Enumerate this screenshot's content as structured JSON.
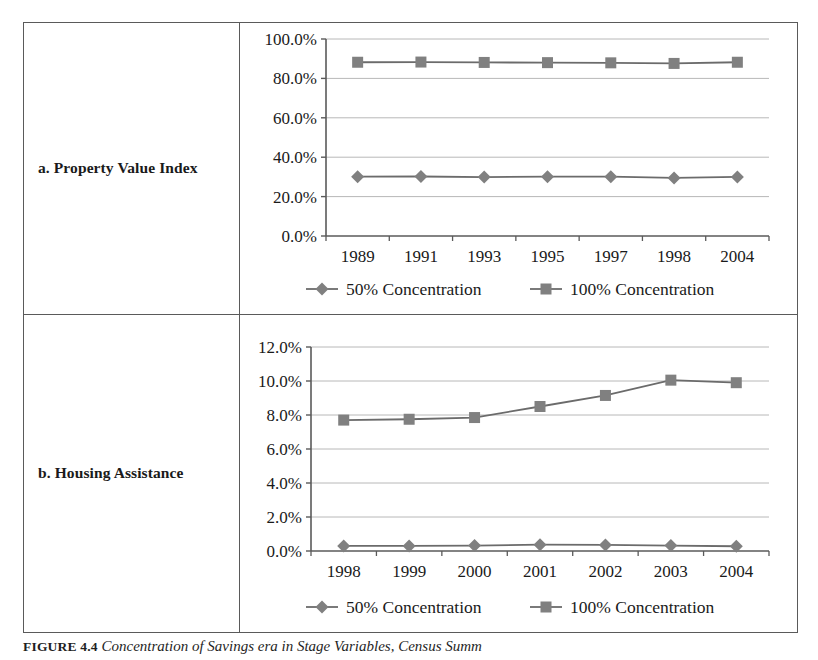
{
  "figure": {
    "caption_label": "FIGURE 4.4",
    "caption_text": "Concentration of Savings era in Stage Variables, Census Summ"
  },
  "rows": [
    {
      "label": "a. Property Value Index"
    },
    {
      "label": "b. Housing Assistance"
    }
  ],
  "legend": {
    "series_50_label": "50% Concentration",
    "series_100_label": "100% Concentration",
    "diamond_icon": "diamond-marker",
    "square_icon": "square-marker"
  },
  "style": {
    "line_color": "#6b6b6b",
    "marker_color": "#808080",
    "grid_color": "#b8b8b8",
    "axis_color": "#5a5a5a",
    "frame_color": "#5a5a5a"
  },
  "chart_data": [
    {
      "id": "property-value-index",
      "type": "line",
      "title": "a. Property Value Index",
      "xlabel": "",
      "ylabel": "",
      "categories": [
        "1989",
        "1991",
        "1993",
        "1995",
        "1997",
        "1998",
        "2004"
      ],
      "ylim": [
        0,
        100
      ],
      "ytick_values": [
        0,
        20,
        40,
        60,
        80,
        100
      ],
      "ytick_labels": [
        "0.0%",
        "20.0%",
        "40.0%",
        "60.0%",
        "80.0%",
        "100.0%"
      ],
      "grid": true,
      "legend_position": "bottom",
      "series": [
        {
          "name": "50% Concentration",
          "marker": "diamond",
          "values": [
            30.1,
            30.2,
            29.9,
            30.1,
            30.1,
            29.5,
            30.0
          ]
        },
        {
          "name": "100% Concentration",
          "marker": "square",
          "values": [
            88.2,
            88.3,
            88.1,
            88.0,
            87.9,
            87.6,
            88.2
          ]
        }
      ]
    },
    {
      "id": "housing-assistance",
      "type": "line",
      "title": "b. Housing Assistance",
      "xlabel": "",
      "ylabel": "",
      "categories": [
        "1998",
        "1999",
        "2000",
        "2001",
        "2002",
        "2003",
        "2004"
      ],
      "ylim": [
        0,
        12
      ],
      "ytick_values": [
        0,
        2,
        4,
        6,
        8,
        10,
        12
      ],
      "ytick_labels": [
        "0.0%",
        "2.0%",
        "4.0%",
        "6.0%",
        "8.0%",
        "10.0%",
        "12.0%"
      ],
      "grid": true,
      "legend_position": "bottom",
      "series": [
        {
          "name": "50% Concentration",
          "marker": "diamond",
          "values": [
            0.3,
            0.3,
            0.32,
            0.37,
            0.36,
            0.32,
            0.28
          ]
        },
        {
          "name": "100% Concentration",
          "marker": "square",
          "values": [
            7.7,
            7.75,
            7.85,
            8.5,
            9.15,
            10.05,
            9.9
          ]
        }
      ]
    }
  ]
}
